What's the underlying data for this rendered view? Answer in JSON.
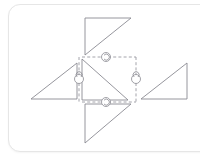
{
  "canvas": {
    "width": 200,
    "height": 159,
    "background_color": "#ffffff"
  },
  "card": {
    "background_color": "#ffffff",
    "border_color": "#e6e6e6",
    "corner_radius": 12
  },
  "figure": {
    "title": "",
    "stroke_color": "#8a8a92",
    "dashed_color": "#9a9aa2",
    "marker_color": "#8a8a92",
    "stroke_width": 0.9
  },
  "shapes": {
    "center_triangle": {
      "name": "center-triangle",
      "points": "82,59 82,100 128,100",
      "orientation": "right angle at bottom-left, hypotenuse top-left to bottom-right"
    },
    "top_triangle": {
      "name": "top-triangle",
      "points": "85,18 131,18 85,55",
      "orientation": "right angle at top-left, hypotenuse bottom-left to top-right"
    },
    "bottom_triangle": {
      "name": "bottom-triangle",
      "points": "85,104 131,104 85,143",
      "orientation": "right angle at top-left, hypotenuse bottom-left to top-right"
    },
    "left_triangle": {
      "name": "left-triangle",
      "points": "31,99 77,99 77,63",
      "orientation": "right angle at bottom-right, hypotenuse bottom-left to top-right"
    },
    "right_triangle": {
      "name": "right-triangle",
      "points": "141,99 187,99 187,63",
      "orientation": "right angle at bottom-right, hypotenuse bottom-left to top-right"
    }
  },
  "mirror_lines": {
    "top": {
      "name": "mirror-line-top",
      "x1": 82,
      "y1": 57,
      "x2": 136,
      "y2": 57,
      "axis": "horizontal"
    },
    "bottom": {
      "name": "mirror-line-bottom",
      "x1": 82,
      "y1": 102,
      "x2": 136,
      "y2": 102,
      "axis": "horizontal"
    },
    "left": {
      "name": "mirror-line-left",
      "x1": 79,
      "y1": 57,
      "x2": 79,
      "y2": 102,
      "axis": "vertical"
    },
    "right": {
      "name": "mirror-line-right",
      "x1": 136,
      "y1": 57,
      "x2": 136,
      "y2": 102,
      "axis": "vertical"
    }
  },
  "markers": {
    "top": {
      "name": "flip-marker-top",
      "cx": 106,
      "cy": 57,
      "orientation": "horizontal"
    },
    "bottom": {
      "name": "flip-marker-bottom",
      "cx": 106,
      "cy": 102,
      "orientation": "horizontal"
    },
    "left": {
      "name": "flip-marker-left",
      "cx": 79,
      "cy": 79,
      "orientation": "vertical"
    },
    "right": {
      "name": "flip-marker-right",
      "cx": 136,
      "cy": 79,
      "orientation": "vertical"
    }
  }
}
